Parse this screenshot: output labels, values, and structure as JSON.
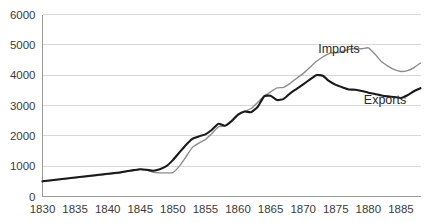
{
  "chart_data": {
    "type": "line",
    "title": "",
    "subtitle": "",
    "xlabel": "",
    "ylabel": "",
    "xlim": [
      1830,
      1888
    ],
    "ylim": [
      0,
      6000
    ],
    "grid": true,
    "grid_axis": "y",
    "legend_position": "inline-annotation",
    "x_ticks": [
      "1830",
      "1835",
      "1840",
      "1845",
      "1850",
      "1855",
      "1860",
      "1865",
      "1870",
      "1875",
      "1880",
      "1885"
    ],
    "y_ticks": [
      "0",
      "1000",
      "2000",
      "3000",
      "4000",
      "5000",
      "6000"
    ],
    "x": [
      1830,
      1832,
      1834,
      1836,
      1838,
      1840,
      1842,
      1844,
      1845,
      1846,
      1847,
      1848,
      1849,
      1850,
      1851,
      1852,
      1853,
      1854,
      1855,
      1856,
      1857,
      1858,
      1859,
      1860,
      1861,
      1862,
      1863,
      1864,
      1865,
      1866,
      1867,
      1868,
      1869,
      1870,
      1871,
      1872,
      1873,
      1874,
      1875,
      1876,
      1877,
      1878,
      1879,
      1880,
      1881,
      1882,
      1883,
      1884,
      1885,
      1886,
      1887,
      1888
    ],
    "series": [
      {
        "name": "Imports",
        "color": "#8c8c8c",
        "values": [
          490,
          540,
          590,
          640,
          680,
          730,
          780,
          860,
          900,
          870,
          800,
          780,
          780,
          790,
          1000,
          1300,
          1620,
          1760,
          1880,
          2080,
          2300,
          2330,
          2500,
          2680,
          2800,
          2900,
          3100,
          3300,
          3450,
          3580,
          3600,
          3730,
          3900,
          4050,
          4250,
          4450,
          4600,
          4720,
          4740,
          4780,
          4850,
          4880,
          4870,
          4900,
          4700,
          4450,
          4300,
          4180,
          4120,
          4150,
          4250,
          4400
        ]
      },
      {
        "name": "Exports",
        "color": "#1a1a1a",
        "values": [
          500,
          550,
          600,
          650,
          700,
          750,
          800,
          870,
          900,
          880,
          850,
          900,
          1000,
          1200,
          1450,
          1700,
          1900,
          1980,
          2050,
          2200,
          2400,
          2330,
          2480,
          2700,
          2800,
          2780,
          2950,
          3300,
          3320,
          3180,
          3220,
          3400,
          3550,
          3700,
          3850,
          4000,
          3980,
          3800,
          3680,
          3600,
          3530,
          3520,
          3480,
          3420,
          3380,
          3330,
          3300,
          3280,
          3250,
          3340,
          3470,
          3570
        ]
      }
    ],
    "annotations": [
      {
        "text": "Imports",
        "x_px": 339,
        "y_px": 53
      },
      {
        "text": "Exports",
        "x_px": 385,
        "y_px": 104
      }
    ]
  },
  "colors": {
    "background": "#ffffff",
    "gridline": "#d8d8d8",
    "axis": "#9a9a9a",
    "tick_text": "#3b3b3b",
    "imports": "#8c8c8c",
    "exports": "#1a1a1a"
  }
}
